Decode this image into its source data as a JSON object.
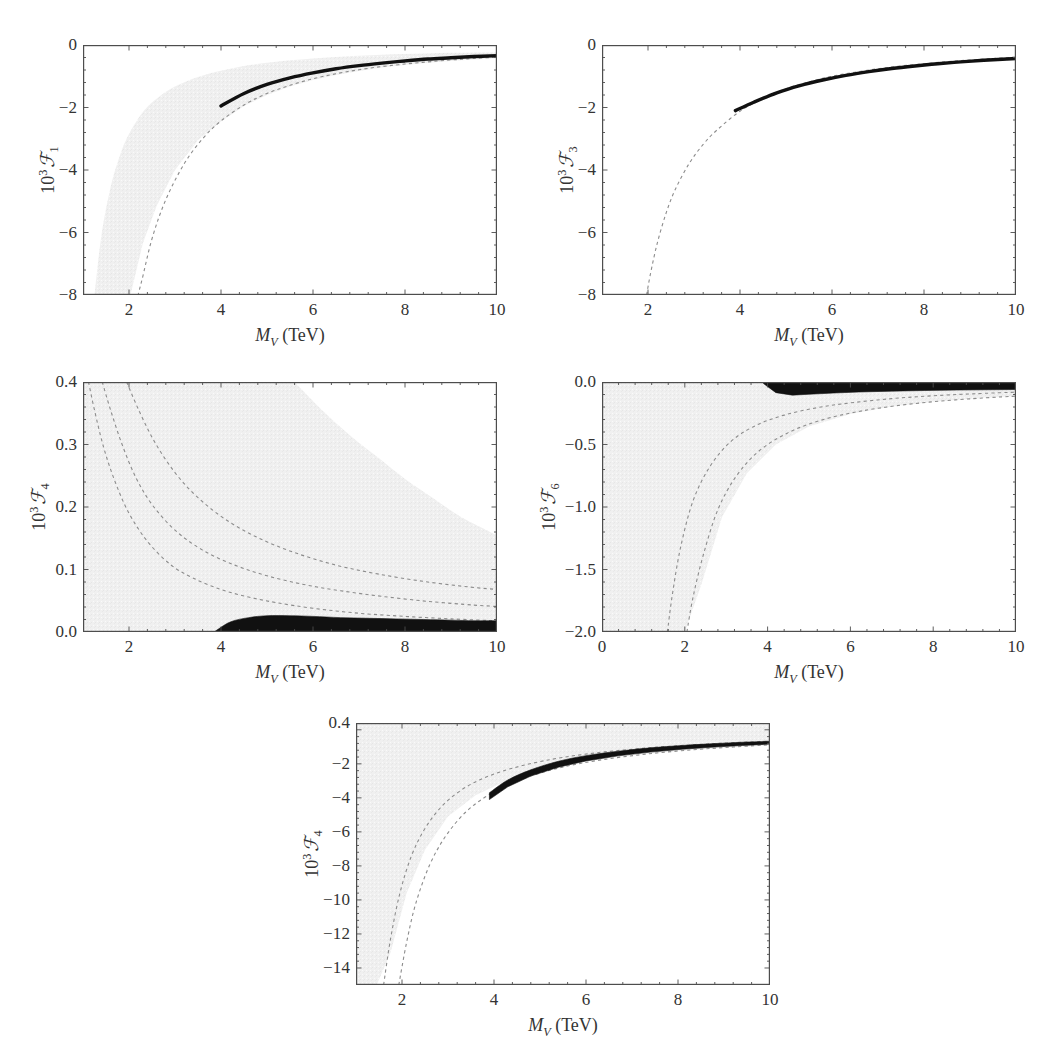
{
  "figure": {
    "background": "#ffffff",
    "band_color": "#f0f0f0",
    "curve_color": "#111111",
    "dashed_color": "#8c8c8c",
    "frame_color": "#4d4d4d"
  },
  "common": {
    "xlabel_sym": "M",
    "xlabel_sub": "V",
    "xlabel_unit": " (TeV)",
    "ylabel_prefix": "10",
    "ylabel_exp": "3",
    "ylabel_script": "ℱ"
  },
  "chart_data": [
    {
      "id": "panel-f1",
      "type": "line",
      "title": "",
      "xlabel": "M_V (TeV)",
      "ylabel": "10^3 F_1",
      "y_index": "1",
      "xlim": [
        1,
        10
      ],
      "ylim": [
        -8,
        0
      ],
      "xticks": [
        2,
        4,
        6,
        8,
        10
      ],
      "xtick_labels": [
        "2",
        "4",
        "6",
        "8",
        "10"
      ],
      "yticks": [
        0,
        -2,
        -4,
        -6,
        -8
      ],
      "ytick_labels": [
        "0",
        "−2",
        "−4",
        "−6",
        "−8"
      ],
      "grid": false,
      "legend": "none",
      "series": [
        {
          "name": "central dashed",
          "style": "dashed",
          "x": [
            1.45,
            1.6,
            1.8,
            2.0,
            2.25,
            2.5,
            2.8,
            3.2,
            3.6,
            4.0,
            4.5,
            5.0,
            5.5,
            6.0,
            6.5,
            7.0,
            7.5,
            8.0,
            8.5,
            9.0,
            9.5,
            10.0
          ],
          "y": [
            -18.6,
            -15.2,
            -12.0,
            -9.7,
            -7.7,
            -6.2,
            -4.95,
            -3.8,
            -3.0,
            -2.43,
            -1.92,
            -1.55,
            -1.29,
            -1.08,
            -0.92,
            -0.79,
            -0.69,
            -0.61,
            -0.54,
            -0.48,
            -0.43,
            -0.39
          ]
        },
        {
          "name": "thick black (M_V >= 4 TeV)",
          "style": "solid-thick",
          "x": [
            4.0,
            4.5,
            5.0,
            5.5,
            6.0,
            6.5,
            7.0,
            7.5,
            8.0,
            8.5,
            9.0,
            9.5,
            10.0
          ],
          "y": [
            -1.95,
            -1.55,
            -1.26,
            -1.05,
            -0.89,
            -0.76,
            -0.66,
            -0.58,
            -0.51,
            -0.45,
            -0.41,
            -0.37,
            -0.34
          ]
        }
      ],
      "band": {
        "name": "allowed grey region",
        "x": [
          1.25,
          1.4,
          1.6,
          1.8,
          2.0,
          2.3,
          2.6,
          3.0,
          3.5,
          4.0,
          4.5,
          5.0,
          5.5,
          6.0,
          6.5,
          7.0,
          7.5,
          8.0,
          8.5,
          9.0,
          9.5,
          10.0
        ],
        "upper": [
          -8.0,
          -6.1,
          -4.55,
          -3.55,
          -2.85,
          -2.15,
          -1.72,
          -1.33,
          -1.02,
          -0.82,
          -0.67,
          -0.57,
          -0.49,
          -0.43,
          -0.38,
          -0.34,
          -0.31,
          -0.29,
          -0.27,
          -0.25,
          -0.24,
          -0.23
        ],
        "lower": [
          -20.0,
          -16.5,
          -12.6,
          -10.1,
          -8.2,
          -6.35,
          -5.15,
          -4.0,
          -3.05,
          -2.45,
          -1.95,
          -1.6,
          -1.33,
          -1.12,
          -0.96,
          -0.83,
          -0.72,
          -0.64,
          -0.57,
          -0.51,
          -0.46,
          -0.42
        ]
      }
    },
    {
      "id": "panel-f3",
      "type": "line",
      "title": "",
      "xlabel": "M_V (TeV)",
      "ylabel": "10^3 F_3",
      "y_index": "3",
      "xlim": [
        1,
        10
      ],
      "ylim": [
        -8,
        0
      ],
      "xticks": [
        2,
        4,
        6,
        8,
        10
      ],
      "xtick_labels": [
        "2",
        "4",
        "6",
        "8",
        "10"
      ],
      "yticks": [
        0,
        -2,
        -4,
        -6,
        -8
      ],
      "ytick_labels": [
        "0",
        "−2",
        "−4",
        "−6",
        "−8"
      ],
      "grid": false,
      "legend": "none",
      "series": [
        {
          "name": "central dashed",
          "style": "dashed",
          "x": [
            1.97,
            2.05,
            2.2,
            2.4,
            2.6,
            2.9,
            3.2,
            3.5,
            4.0,
            4.5,
            5.0,
            5.5,
            6.0,
            6.5,
            7.0,
            7.5,
            8.0,
            8.5,
            9.0,
            9.5,
            10.0
          ],
          "y": [
            -8.0,
            -7.35,
            -6.35,
            -5.35,
            -4.6,
            -3.78,
            -3.18,
            -2.72,
            -2.12,
            -1.71,
            -1.4,
            -1.18,
            -1.0,
            -0.87,
            -0.76,
            -0.67,
            -0.6,
            -0.53,
            -0.48,
            -0.43,
            -0.39
          ]
        },
        {
          "name": "thick black (M_V >= 4 TeV)",
          "style": "solid-thick",
          "x": [
            3.9,
            4.3,
            4.8,
            5.3,
            5.8,
            6.3,
            6.8,
            7.3,
            7.8,
            8.3,
            8.8,
            9.3,
            10.0
          ],
          "y": [
            -2.1,
            -1.83,
            -1.53,
            -1.3,
            -1.12,
            -0.97,
            -0.85,
            -0.75,
            -0.67,
            -0.6,
            -0.54,
            -0.49,
            -0.43
          ]
        }
      ],
      "band": null
    },
    {
      "id": "panel-f4-upper",
      "type": "line",
      "title": "",
      "xlabel": "M_V (TeV)",
      "ylabel": "10^3 F_4",
      "y_index": "4",
      "xlim": [
        1,
        10
      ],
      "ylim": [
        0.0,
        0.4
      ],
      "xticks": [
        2,
        4,
        6,
        8,
        10
      ],
      "xtick_labels": [
        "2",
        "4",
        "6",
        "8",
        "10"
      ],
      "yticks": [
        0.4,
        0.3,
        0.2,
        0.1,
        0.0
      ],
      "ytick_labels": [
        "0.4",
        "0.3",
        "0.2",
        "0.1",
        "0.0"
      ],
      "grid": false,
      "legend": "none",
      "series": [
        {
          "name": "dashed contour 1",
          "style": "dashed",
          "x": [
            1.12,
            1.25,
            1.45,
            1.7,
            2.0,
            2.4,
            2.9,
            3.4,
            4.0,
            4.6,
            5.2,
            6.0,
            7.0,
            8.0,
            9.0,
            10.0
          ],
          "y": [
            0.4,
            0.355,
            0.295,
            0.24,
            0.19,
            0.145,
            0.108,
            0.086,
            0.068,
            0.056,
            0.047,
            0.038,
            0.03,
            0.025,
            0.021,
            0.018
          ]
        },
        {
          "name": "dashed contour 2",
          "style": "dashed",
          "x": [
            1.42,
            1.6,
            1.85,
            2.15,
            2.5,
            3.0,
            3.6,
            4.3,
            5.0,
            5.8,
            6.6,
            7.5,
            8.5,
            9.5,
            10.0
          ],
          "y": [
            0.4,
            0.355,
            0.3,
            0.247,
            0.204,
            0.163,
            0.131,
            0.107,
            0.09,
            0.076,
            0.066,
            0.057,
            0.049,
            0.043,
            0.041
          ]
        },
        {
          "name": "dashed contour 3",
          "style": "dashed",
          "x": [
            1.95,
            2.2,
            2.55,
            3.0,
            3.5,
            4.1,
            4.8,
            5.6,
            6.5,
            7.4,
            8.4,
            9.4,
            10.0
          ],
          "y": [
            0.4,
            0.357,
            0.305,
            0.255,
            0.215,
            0.18,
            0.151,
            0.127,
            0.107,
            0.093,
            0.081,
            0.072,
            0.068
          ]
        }
      ],
      "band": {
        "name": "grey region (white cut-out upper-right)",
        "boundary_x": [
          5.6,
          6.2,
          6.8,
          7.4,
          8.0,
          8.6,
          9.2,
          10.0
        ],
        "boundary_y": [
          0.4,
          0.355,
          0.315,
          0.28,
          0.245,
          0.215,
          0.185,
          0.155
        ]
      },
      "black_region": {
        "name": "thick black allowed sliver",
        "x": [
          3.85,
          4.2,
          4.6,
          5.0,
          5.5,
          6.0,
          6.6,
          7.2,
          7.8,
          8.4,
          9.0,
          9.5,
          10.0
        ],
        "upper": [
          0.0,
          0.016,
          0.023,
          0.026,
          0.026,
          0.025,
          0.023,
          0.022,
          0.021,
          0.02,
          0.019,
          0.018,
          0.018
        ],
        "lower": [
          0.0,
          0.0,
          0.0,
          0.0,
          0.0,
          0.0,
          0.0,
          0.0,
          0.0,
          0.0,
          0.0,
          0.0,
          0.0
        ]
      }
    },
    {
      "id": "panel-f6",
      "type": "line",
      "title": "",
      "xlabel": "M_V (TeV)",
      "ylabel": "10^3 F_6",
      "y_index": "6",
      "xlim": [
        0,
        10
      ],
      "ylim": [
        -2.0,
        0.0
      ],
      "xticks": [
        0,
        2,
        4,
        6,
        8,
        10
      ],
      "xtick_labels": [
        "0",
        "2",
        "4",
        "6",
        "8",
        "10"
      ],
      "yticks": [
        0.0,
        -0.5,
        -1.0,
        -1.5,
        -2.0
      ],
      "ytick_labels": [
        "0.0",
        "−0.5",
        "−1.0",
        "−1.5",
        "−2.0"
      ],
      "grid": false,
      "legend": "none",
      "series": [
        {
          "name": "dashed contour 1",
          "style": "dashed",
          "x": [
            1.58,
            1.7,
            1.9,
            2.2,
            2.6,
            3.1,
            3.7,
            4.4,
            5.2,
            6.0,
            7.0,
            8.0,
            9.0,
            10.0
          ],
          "y": [
            -2.0,
            -1.7,
            -1.32,
            -0.95,
            -0.68,
            -0.48,
            -0.35,
            -0.265,
            -0.205,
            -0.167,
            -0.133,
            -0.11,
            -0.094,
            -0.081
          ]
        },
        {
          "name": "dashed contour 2",
          "style": "dashed",
          "x": [
            2.05,
            2.2,
            2.45,
            2.8,
            3.25,
            3.8,
            4.5,
            5.3,
            6.2,
            7.2,
            8.2,
            9.2,
            10.0
          ],
          "y": [
            -2.0,
            -1.72,
            -1.38,
            -1.02,
            -0.75,
            -0.55,
            -0.405,
            -0.305,
            -0.236,
            -0.186,
            -0.152,
            -0.128,
            -0.113
          ]
        }
      ],
      "band": {
        "name": "grey region",
        "x": [
          0.0,
          0.5,
          1.0,
          1.5,
          2.0,
          2.4,
          2.9,
          3.5,
          4.2,
          5.0,
          6.0,
          7.0,
          8.0,
          9.0,
          10.0
        ],
        "upper": [
          0.0,
          0.0,
          0.0,
          0.0,
          0.0,
          0.0,
          0.0,
          0.0,
          0.0,
          0.0,
          0.0,
          0.0,
          0.0,
          0.0,
          0.0
        ],
        "lower": [
          -2.0,
          -2.0,
          -2.0,
          -2.0,
          -2.0,
          -1.62,
          -1.08,
          -0.73,
          -0.5,
          -0.355,
          -0.255,
          -0.196,
          -0.158,
          -0.132,
          -0.112
        ]
      },
      "black_region": {
        "name": "thick black allowed sliver near zero",
        "x": [
          3.9,
          4.2,
          4.6,
          5.0,
          5.6,
          6.2,
          7.0,
          7.8,
          8.6,
          9.3,
          10.0
        ],
        "upper": [
          0.0,
          0.0,
          0.0,
          0.0,
          0.0,
          0.0,
          0.0,
          0.0,
          0.0,
          0.0,
          0.0
        ],
        "lower": [
          -0.012,
          -0.085,
          -0.105,
          -0.098,
          -0.088,
          -0.08,
          -0.073,
          -0.068,
          -0.064,
          -0.062,
          -0.06
        ]
      }
    },
    {
      "id": "panel-f4-lower",
      "type": "line",
      "title": "",
      "xlabel": "M_V (TeV)",
      "ylabel": "10^3 F_4",
      "y_index": "4",
      "xlim": [
        1,
        10
      ],
      "ylim": [
        -15,
        0.4
      ],
      "xticks": [
        2,
        4,
        6,
        8,
        10
      ],
      "xtick_labels": [
        "2",
        "4",
        "6",
        "8",
        "10"
      ],
      "yticks": [
        0.4,
        -2,
        -4,
        -6,
        -8,
        -10,
        -12,
        -14
      ],
      "ytick_labels": [
        "0.4",
        "−2",
        "−4",
        "−6",
        "−8",
        "−10",
        "−12",
        "−14"
      ],
      "grid": false,
      "legend": "none",
      "series": [
        {
          "name": "dashed contour 1",
          "style": "dashed",
          "x": [
            1.6,
            1.75,
            1.95,
            2.2,
            2.5,
            2.9,
            3.4,
            4.0,
            4.7,
            5.5,
            6.4,
            7.4,
            8.4,
            9.2,
            10.0
          ],
          "y": [
            -15.0,
            -12.3,
            -9.65,
            -7.45,
            -5.8,
            -4.4,
            -3.35,
            -2.6,
            -2.05,
            -1.62,
            -1.3,
            -1.05,
            -0.87,
            -0.76,
            -0.67
          ]
        },
        {
          "name": "dashed contour 2",
          "style": "dashed",
          "x": [
            1.93,
            2.1,
            2.3,
            2.6,
            2.95,
            3.4,
            3.95,
            4.6,
            5.4,
            6.3,
            7.3,
            8.3,
            9.2,
            10.0
          ],
          "y": [
            -15.0,
            -12.5,
            -10.2,
            -7.95,
            -6.25,
            -4.8,
            -3.72,
            -2.9,
            -2.25,
            -1.78,
            -1.43,
            -1.18,
            -1.01,
            -0.88
          ]
        }
      ],
      "band": {
        "name": "grey region",
        "x": [
          1.0,
          1.2,
          1.45,
          1.75,
          2.1,
          2.5,
          3.0,
          3.6,
          4.3,
          5.1,
          6.0,
          7.0,
          8.0,
          9.0,
          10.0
        ],
        "upper": [
          0.4,
          0.4,
          0.4,
          0.4,
          0.4,
          0.4,
          0.4,
          0.4,
          0.4,
          0.4,
          0.4,
          0.4,
          0.4,
          0.4,
          0.4
        ],
        "lower": [
          -15.0,
          -15.0,
          -15.0,
          -13.1,
          -9.6,
          -7.05,
          -5.1,
          -3.85,
          -2.95,
          -2.3,
          -1.85,
          -1.5,
          -1.25,
          -1.06,
          -0.92
        ]
      },
      "black_region": {
        "name": "thick black allowed band (M_V >= 4 TeV)",
        "x": [
          3.9,
          4.3,
          4.8,
          5.4,
          6.0,
          6.7,
          7.4,
          8.1,
          8.8,
          9.4,
          10.0
        ],
        "upper": [
          -3.7,
          -2.95,
          -2.35,
          -1.85,
          -1.52,
          -1.26,
          -1.06,
          -0.92,
          -0.81,
          -0.73,
          -0.67
        ],
        "lower": [
          -4.1,
          -3.35,
          -2.72,
          -2.2,
          -1.83,
          -1.53,
          -1.31,
          -1.14,
          -1.01,
          -0.92,
          -0.84
        ]
      }
    }
  ]
}
